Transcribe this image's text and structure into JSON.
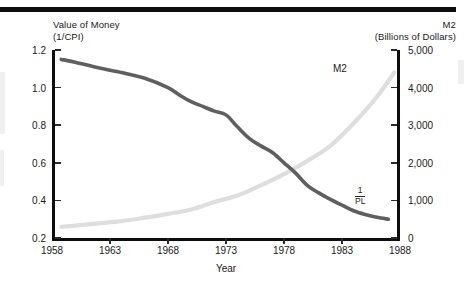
{
  "chart_data": {
    "type": "line",
    "title": "",
    "xlabel": "Year",
    "ylabel_left_line1": "Value of Money",
    "ylabel_left_line2": "(1/CPI)",
    "ylabel_right_line1": "M2",
    "ylabel_right_line2": "(Billions of Dollars)",
    "xlim": [
      1958,
      1988
    ],
    "xticks": [
      "1958",
      "1963",
      "1968",
      "1973",
      "1978",
      "1983",
      "1988"
    ],
    "xtick_values": [
      1958,
      1963,
      1968,
      1973,
      1978,
      1983,
      1988
    ],
    "ylim_left": [
      0.2,
      1.2
    ],
    "yticks_left": [
      "0.2",
      "0.4",
      "0.6",
      "0.8",
      "1.0",
      "1.2"
    ],
    "ytick_values_left": [
      0.2,
      0.4,
      0.6,
      0.8,
      1.0,
      1.2
    ],
    "ylim_right": [
      0,
      5000
    ],
    "yticks_right": [
      "0",
      "1,000",
      "2,000",
      "3,000",
      "4,000",
      "5,000"
    ],
    "ytick_values_right": [
      0,
      1000,
      2000,
      3000,
      4000,
      5000
    ],
    "grid": false,
    "legend": "inline annotations",
    "annotations": [
      {
        "name": "m2-label",
        "text": "M2",
        "x": 1984.2,
        "y_right": 4550
      },
      {
        "name": "inverse-pl-label",
        "numerator": "1",
        "denominator": "PL",
        "x": 1986.1,
        "y_right": 1150
      }
    ],
    "series": [
      {
        "name": "1/PL",
        "axis": "left",
        "color": "#5f5f5f",
        "width": 3.6,
        "x": [
          1958.8,
          1960,
          1962,
          1964,
          1966,
          1968,
          1969,
          1970,
          1971,
          1972,
          1973,
          1974,
          1975,
          1976,
          1977,
          1978,
          1979,
          1980,
          1981,
          1982,
          1983,
          1984,
          1985,
          1986,
          1987
        ],
        "values": [
          1.15,
          1.135,
          1.105,
          1.08,
          1.05,
          1.0,
          0.96,
          0.925,
          0.9,
          0.875,
          0.855,
          0.79,
          0.73,
          0.69,
          0.655,
          0.6,
          0.545,
          0.48,
          0.44,
          0.405,
          0.375,
          0.345,
          0.325,
          0.31,
          0.3
        ]
      },
      {
        "name": "M2",
        "axis": "right",
        "color": "#dedede",
        "width": 4.2,
        "x": [
          1958.8,
          1960,
          1962,
          1964,
          1966,
          1968,
          1970,
          1972,
          1974,
          1976,
          1978,
          1980,
          1982,
          1984,
          1986,
          1987.5
        ],
        "values": [
          300,
          330,
          390,
          450,
          540,
          640,
          760,
          960,
          1130,
          1400,
          1700,
          2050,
          2450,
          3050,
          3750,
          4400
        ]
      }
    ]
  }
}
